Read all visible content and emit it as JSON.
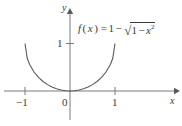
{
  "figure": {
    "title": "",
    "formula": {
      "fn_name": "f",
      "fn_var": "x",
      "equals": "=",
      "const_one": "1",
      "minus": "−",
      "radical": "√",
      "radicand_one": "1",
      "radicand_minus": "−",
      "radicand_var": "x",
      "radicand_exp": "2",
      "plain": "f(x) = 1 − √(1 − x²)"
    },
    "axes": {
      "x_label": "x",
      "y_label": "y",
      "origin_label": "0",
      "x_ticks": [
        "−1",
        "1"
      ],
      "y_ticks": [
        "1"
      ],
      "x_arrow_icon": "arrow-right-icon",
      "y_arrow_icon": "arrow-up-icon"
    },
    "colors": {
      "axis": "#7a7a7a",
      "curve": "#5a5a5a",
      "text": "#3a3a3a",
      "background": "#ffffff"
    }
  },
  "chart_data": {
    "type": "line",
    "title": "",
    "subtitle": "",
    "xlabel": "x",
    "ylabel": "y",
    "xlim": [
      -1.55,
      1.55
    ],
    "ylim": [
      -0.38,
      1.55
    ],
    "grid": false,
    "legend": null,
    "annotations": [
      {
        "text": "f(x) = 1 − √(1 − x²)",
        "x": 0.18,
        "y": 1.38
      }
    ],
    "xticks": [
      -1,
      0,
      1
    ],
    "xticklabels": [
      "−1",
      "0",
      "1"
    ],
    "yticks": [
      1
    ],
    "yticklabels": [
      "1"
    ],
    "series": [
      {
        "name": "f(x) = 1 - sqrt(1 - x^2)",
        "equation": "y = 1 - sqrt(1 - x^2)",
        "domain": [
          -1,
          1
        ],
        "x": [
          -1.0,
          -0.95,
          -0.9,
          -0.8,
          -0.7,
          -0.6,
          -0.5,
          -0.4,
          -0.3,
          -0.2,
          -0.1,
          0.0,
          0.1,
          0.2,
          0.3,
          0.4,
          0.5,
          0.6,
          0.7,
          0.8,
          0.9,
          0.95,
          1.0
        ],
        "y": [
          1.0,
          0.688,
          0.564,
          0.4,
          0.286,
          0.2,
          0.134,
          0.083,
          0.046,
          0.02,
          0.005,
          0.0,
          0.005,
          0.02,
          0.046,
          0.083,
          0.134,
          0.2,
          0.286,
          0.4,
          0.564,
          0.688,
          1.0
        ]
      }
    ]
  }
}
